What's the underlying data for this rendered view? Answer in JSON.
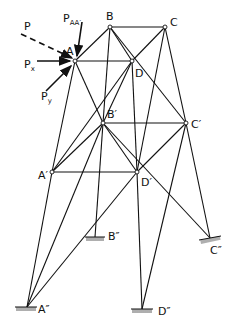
{
  "figure": {
    "type": "space-truss-tower",
    "nodes": [
      {
        "id": "A",
        "label": "A",
        "x": 75,
        "y": 61
      },
      {
        "id": "B",
        "label": "B",
        "x": 110,
        "y": 27
      },
      {
        "id": "C",
        "label": "C",
        "x": 165,
        "y": 27
      },
      {
        "id": "D",
        "label": "D",
        "x": 132,
        "y": 61
      },
      {
        "id": "Ap",
        "label": "A′",
        "x": 52,
        "y": 172
      },
      {
        "id": "Bp",
        "label": "B′",
        "x": 103,
        "y": 123
      },
      {
        "id": "Cp",
        "label": "C′",
        "x": 186,
        "y": 123
      },
      {
        "id": "Dp",
        "label": "D′",
        "x": 137,
        "y": 172
      },
      {
        "id": "App",
        "label": "A″",
        "x": 27,
        "y": 307
      },
      {
        "id": "Bpp",
        "label": "B″",
        "x": 95,
        "y": 237
      },
      {
        "id": "Cpp",
        "label": "C″",
        "x": 210,
        "y": 238
      },
      {
        "id": "Dpp",
        "label": "D″",
        "x": 142,
        "y": 309
      }
    ],
    "loads": [
      {
        "label": "P",
        "style": "dashed"
      },
      {
        "label": "P",
        "subscript": "AA′",
        "style": "solid"
      },
      {
        "label": "P",
        "subscript": "x",
        "style": "solid"
      },
      {
        "label": "P",
        "subscript": "y",
        "style": "solid"
      }
    ],
    "supports": [
      "A″",
      "B″",
      "C″",
      "D″"
    ]
  }
}
